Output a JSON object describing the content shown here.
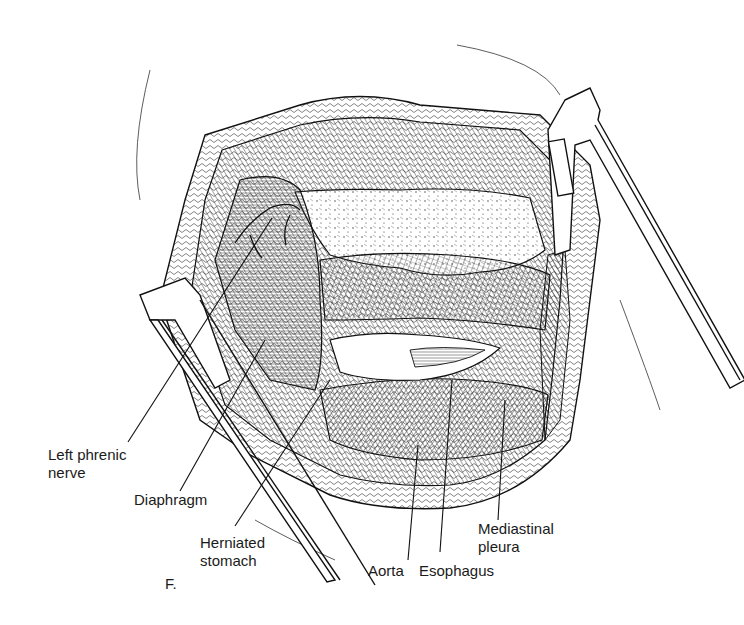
{
  "figure": {
    "panel_letter": "F.",
    "labels": [
      {
        "id": "left-phrenic-nerve",
        "lines": [
          "Left phrenic",
          "nerve"
        ]
      },
      {
        "id": "diaphragm",
        "lines": [
          "Diaphragm"
        ]
      },
      {
        "id": "herniated-stomach",
        "lines": [
          "Herniated",
          "stomach"
        ]
      },
      {
        "id": "aorta",
        "lines": [
          "Aorta"
        ]
      },
      {
        "id": "esophagus",
        "lines": [
          "Esophagus"
        ]
      },
      {
        "id": "mediastinal-pleura",
        "lines": [
          "Mediastinal",
          "pleura"
        ]
      }
    ]
  }
}
